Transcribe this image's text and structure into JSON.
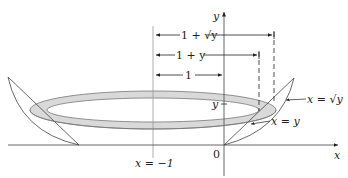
{
  "diagram": {
    "axes": {
      "x_label": "x",
      "y_label": "y",
      "origin_label": "0"
    },
    "vertical_line_label": "x = −1",
    "dimension_labels": {
      "outer_radius": "1 + √y",
      "inner_radius": "1 + y",
      "axis_distance": "1"
    },
    "curve_labels": {
      "sqrt_curve": "x = √y",
      "line": "x = y"
    },
    "height_tick_label": "y",
    "colors": {
      "ring_fill": "#d9d9d9",
      "stroke": "#231f20",
      "thin_line": "#8a8a8a"
    }
  }
}
